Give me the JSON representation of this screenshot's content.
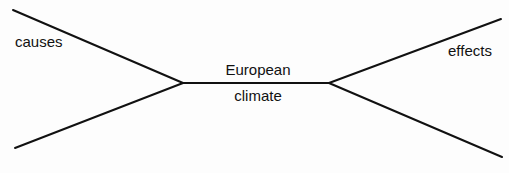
{
  "diagram": {
    "type": "cause-effect bowtie",
    "center_node": {
      "line1": "European",
      "line2": "climate"
    },
    "left_label": "causes",
    "right_label": "effects",
    "line_color": "#111111",
    "background": "#fdfdfd"
  }
}
